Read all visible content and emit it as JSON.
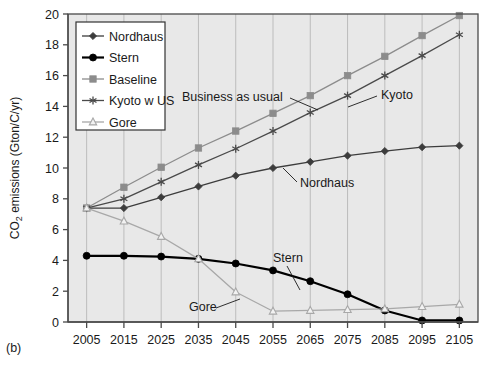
{
  "panel": {
    "label": "(b)"
  },
  "chart_data": {
    "type": "line",
    "title": "",
    "xlabel": "",
    "ylabel": "CO2 emissions (Gton/C/yr)",
    "ylabel_parts": {
      "pre": "CO",
      "sub": "2",
      "post": " emissions (Gton/C/yr)"
    },
    "x": [
      2005,
      2015,
      2025,
      2035,
      2045,
      2055,
      2065,
      2075,
      2085,
      2095,
      2105
    ],
    "xlim": [
      2000,
      2110
    ],
    "ylim": [
      0,
      20
    ],
    "xticks": [
      "2005",
      "2015",
      "2025",
      "2035",
      "2045",
      "2055",
      "2065",
      "2075",
      "2085",
      "2095",
      "2105"
    ],
    "yticks": [
      "0",
      "2",
      "4",
      "6",
      "8",
      "10",
      "12",
      "14",
      "16",
      "18",
      "20"
    ],
    "grid": true,
    "grid_axis": "x",
    "plot_background": "#e8e8e8",
    "legend_position": "upper-left",
    "series": [
      {
        "name": "Nordhaus",
        "marker": "filled-diamond",
        "color": "#3c3c3c",
        "values": [
          7.4,
          7.4,
          8.1,
          8.8,
          9.5,
          10.0,
          10.4,
          10.8,
          11.1,
          11.35,
          11.45
        ]
      },
      {
        "name": "Stern",
        "marker": "filled-circle",
        "color": "#000000",
        "values": [
          4.3,
          4.3,
          4.25,
          4.1,
          3.8,
          3.35,
          2.65,
          1.8,
          0.75,
          0.1,
          0.1
        ]
      },
      {
        "name": "Baseline",
        "marker": "filled-square",
        "color": "#8c8c8c",
        "values": [
          7.4,
          8.75,
          10.05,
          11.3,
          12.4,
          13.55,
          14.7,
          16.0,
          17.25,
          18.6,
          19.9
        ]
      },
      {
        "name": "Kyoto w US",
        "marker": "asterisk",
        "color": "#4a4a4a",
        "values": [
          7.4,
          8.0,
          9.1,
          10.2,
          11.25,
          12.4,
          13.6,
          14.7,
          16.0,
          17.3,
          18.65
        ]
      },
      {
        "name": "Gore",
        "marker": "open-triangle",
        "color": "#a8a8a8",
        "values": [
          7.4,
          6.55,
          5.55,
          4.1,
          1.95,
          0.7,
          0.75,
          0.8,
          0.85,
          1.0,
          1.15
        ]
      }
    ],
    "annotations": [
      {
        "text": "Business as usual",
        "x_px": 182,
        "y_px": 101
      },
      {
        "text": "Kyoto",
        "x_px": 381,
        "y_px": 99
      },
      {
        "text": "Nordhaus",
        "x_px": 300,
        "y_px": 187
      },
      {
        "text": "Stern",
        "x_px": 273,
        "y_px": 262
      },
      {
        "text": "Gore",
        "x_px": 189,
        "y_px": 311
      }
    ]
  },
  "legend": {
    "entries": [
      {
        "label": "Nordhaus"
      },
      {
        "label": "Stern"
      },
      {
        "label": "Baseline"
      },
      {
        "label": "Kyoto w US"
      },
      {
        "label": "Gore"
      }
    ]
  }
}
